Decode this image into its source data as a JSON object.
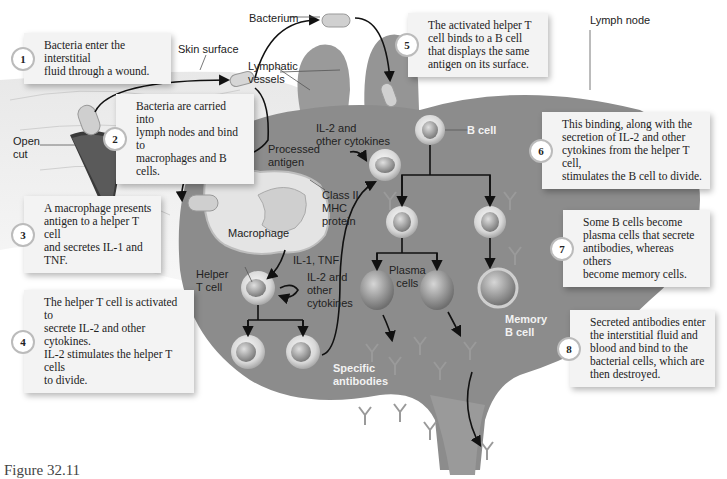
{
  "figure": {
    "caption": "Figure 32.11"
  },
  "steps": [
    {
      "num": "1",
      "text": "Bacteria enter the interstitial\nfluid through a wound."
    },
    {
      "num": "2",
      "text": "Bacteria are carried into\nlymph nodes and bind to\nmacrophages and B cells."
    },
    {
      "num": "3",
      "text": "A macrophage presents\nantigen to a helper T cell\nand secretes IL-1 and TNF."
    },
    {
      "num": "4",
      "text": "The helper T cell is activated to\nsecrete IL-2 and other cytokines.\nIL-2 stimulates the helper T cells\nto divide."
    },
    {
      "num": "5",
      "text": "The activated helper T\ncell binds to a B cell\nthat displays the same\nantigen on its surface."
    },
    {
      "num": "6",
      "text": "This binding, along with the\nsecretion of IL-2 and other\ncytokines from the helper T cell,\nstimulates the B cell to divide."
    },
    {
      "num": "7",
      "text": "Some B cells become\nplasma cells that secrete\nantibodies, whereas others\nbecome memory cells."
    },
    {
      "num": "8",
      "text": "Secreted antibodies enter\nthe interstitial fluid and\nblood and bind to the\nbacterial cells, which are\nthen destroyed."
    }
  ],
  "labels": {
    "bacterium": "Bacterium",
    "skin_surface": "Skin surface",
    "lymphatic_vessels": "Lymphatic\nvessels",
    "open_cut": "Open\ncut",
    "lymph_node": "Lymph node",
    "il2_top": "IL-2 and\nother cytokines",
    "processed_antigen": "Processed\nantigen",
    "class_ii_mhc": "Class II\nMHC\nprotein",
    "macrophage": "Macrophage",
    "b_cell": "B cell",
    "il1_tnf": "IL-1, TNF",
    "helper_t_cell": "Helper\nT cell",
    "il2_bottom": "IL-2 and\nother\ncytokines",
    "plasma_cells": "Plasma\ncells",
    "memory_b_cell": "Memory\nB cell",
    "specific_antibodies": "Specific\nantibodies"
  },
  "colors": {
    "node_body": "#8a8a8a",
    "box_bg": "#f3f3f3",
    "arrow": "#111111"
  }
}
